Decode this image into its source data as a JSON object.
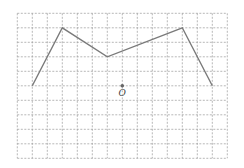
{
  "diagram": {
    "type": "grid-polyline",
    "grid": {
      "columns": 14,
      "rows": 10,
      "origin_px": [
        17.3,
        13.3
      ],
      "cell_w": 15.0,
      "cell_h": 14.5,
      "line_color": "#9a9a9a",
      "dash": "2,1.5"
    },
    "polyline": {
      "points": [
        [
          1,
          5
        ],
        [
          3,
          1
        ],
        [
          6,
          3
        ],
        [
          11,
          1
        ],
        [
          13,
          5
        ]
      ],
      "color": "#7a7a7a",
      "width": 1.4
    },
    "point": {
      "name": "O",
      "grid": [
        7,
        5
      ],
      "label": "O",
      "color": "#666666"
    }
  }
}
